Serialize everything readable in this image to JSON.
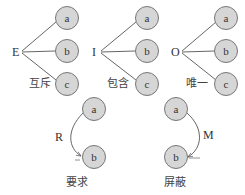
{
  "colors": {
    "node_fill": "#d6d6d6",
    "node_stroke": "#777777",
    "line": "#555555",
    "text": "#333333"
  },
  "groups": [
    {
      "operator": "E",
      "caption": "互斥",
      "nodes": [
        "a",
        "b",
        "c"
      ]
    },
    {
      "operator": "I",
      "caption": "包含",
      "nodes": [
        "a",
        "b",
        "c"
      ]
    },
    {
      "operator": "O",
      "caption": "唯一",
      "nodes": [
        "a",
        "b",
        "c"
      ]
    }
  ],
  "relations": [
    {
      "operator": "R",
      "caption": "要求",
      "from": "a",
      "to": "b"
    },
    {
      "operator": "M",
      "caption": "屏蔽",
      "from": "a",
      "to": "b"
    }
  ]
}
